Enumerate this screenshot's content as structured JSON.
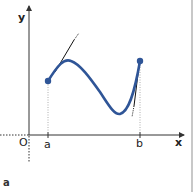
{
  "figure": {
    "axis_labels": {
      "x": "x",
      "y": "y",
      "origin": "O"
    },
    "tick_labels": {
      "a": "a",
      "b": "b"
    },
    "caption": "a",
    "colors": {
      "curve": "#2f5597",
      "axes": "#333333",
      "tangent": "#111111",
      "guides": "#999999",
      "border": "#c8c8c8"
    }
  }
}
